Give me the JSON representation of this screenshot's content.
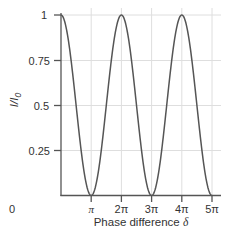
{
  "chart_data": {
    "type": "line",
    "title": "",
    "xlabel": "Phase difference δ",
    "ylabel": "I/I0",
    "function": "I/I0 = cos^2(δ/2)",
    "x_range": [
      0,
      15.708
    ],
    "ylim": [
      0,
      1
    ],
    "grid": true,
    "legend": null,
    "x_ticks": [
      {
        "value": 3.1416,
        "label": "π"
      },
      {
        "value": 6.2832,
        "label": "2π"
      },
      {
        "value": 9.4248,
        "label": "3π"
      },
      {
        "value": 12.5664,
        "label": "4π"
      },
      {
        "value": 15.708,
        "label": "5π"
      }
    ],
    "y_ticks": [
      {
        "value": 0,
        "label": "0"
      },
      {
        "value": 0.25,
        "label": "0.25"
      },
      {
        "value": 0.5,
        "label": "0.5"
      },
      {
        "value": 0.75,
        "label": "0.75"
      },
      {
        "value": 1,
        "label": "1"
      }
    ],
    "series": [
      {
        "name": "I/I0",
        "x_labels": [
          "0",
          "π/2",
          "π",
          "3π/2",
          "2π",
          "5π/2",
          "3π",
          "7π/2",
          "4π",
          "9π/2",
          "5π"
        ],
        "x": [
          0,
          1.5708,
          3.1416,
          4.7124,
          6.2832,
          7.854,
          9.4248,
          10.9956,
          12.5664,
          14.1372,
          15.708
        ],
        "y": [
          1,
          0.5,
          0,
          0.5,
          1,
          0.5,
          0,
          0.5,
          1,
          0.5,
          0
        ]
      }
    ],
    "colors": {
      "curve": "#555555",
      "axis": "#555555",
      "grid": "#dddddd"
    }
  },
  "labels": {
    "y_axis_label_main": "I/I",
    "y_axis_label_sub": "0",
    "x_axis_label_main": "Phase difference ",
    "x_axis_label_symbol": "δ",
    "y_ticks": [
      "1",
      "0.75",
      "0.5",
      "0.25",
      "0"
    ],
    "x_ticks": [
      "π",
      "2π",
      "3π",
      "4π",
      "5π"
    ]
  }
}
